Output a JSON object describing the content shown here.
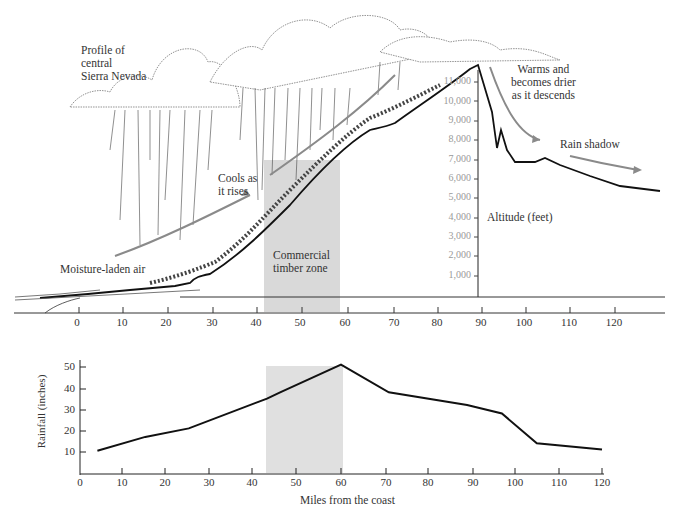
{
  "profile": {
    "title_lines": [
      "Profile of",
      "central",
      "Sierra Nevada"
    ],
    "labels": {
      "cools": [
        "Cools as",
        "it rises"
      ],
      "moisture": "Moisture-laden air",
      "timber": [
        "Commercial",
        "timber zone"
      ],
      "warms": [
        "Warms and",
        "becomes drier",
        "as it descends"
      ],
      "rain_shadow": "Rain shadow",
      "altitude_axis": "Altitude (feet)"
    },
    "altitude_ticks": [
      "11,000",
      "10,000",
      "9,000",
      "8,000",
      "7,000",
      "6,000",
      "5,000",
      "4,000",
      "3,000",
      "2,000",
      "1,000"
    ],
    "x_ticks": [
      "0",
      "10",
      "20",
      "30",
      "40",
      "50",
      "60",
      "70",
      "80",
      "90",
      "100",
      "110",
      "120"
    ]
  },
  "chart_data": {
    "type": "line",
    "title": "",
    "xlabel": "Miles from the coast",
    "ylabel": "Rainfall (inches)",
    "x_ticks": [
      "0",
      "10",
      "20",
      "30",
      "40",
      "50",
      "60",
      "70",
      "80",
      "90",
      "100",
      "110",
      "120"
    ],
    "y_ticks": [
      "10",
      "20",
      "30",
      "40",
      "50"
    ],
    "xlim": [
      0,
      120
    ],
    "ylim": [
      0,
      53
    ],
    "grid": false,
    "shaded_region": {
      "label": "Commercial timber zone",
      "x_start": 43,
      "x_end": 60
    },
    "series": [
      {
        "name": "Rainfall",
        "x": [
          4,
          15,
          25,
          43,
          46,
          60,
          71,
          89,
          97,
          105,
          120
        ],
        "y": [
          10.5,
          17,
          21,
          35,
          38,
          51,
          38,
          32,
          28,
          14,
          11
        ]
      }
    ],
    "profile_elevation_feet": {
      "x_miles": [
        -5,
        0,
        10,
        20,
        27,
        30,
        40,
        50,
        60,
        67,
        70,
        78,
        88,
        91,
        96,
        97,
        99,
        101,
        110,
        120,
        130
      ],
      "y_feet": [
        0,
        200,
        400,
        600,
        800,
        1200,
        2500,
        4500,
        7000,
        8100,
        8200,
        9500,
        11000,
        11500,
        7500,
        8000,
        6700,
        6700,
        6500,
        5500,
        5400
      ]
    }
  }
}
